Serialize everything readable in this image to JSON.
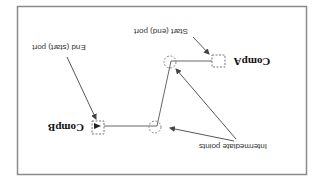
{
  "diagram": {
    "orientation": "rotated 180 degrees",
    "colors": {
      "frame": "#8a8a8a",
      "line": "#555555",
      "dashed": "#777777",
      "text": "#333333",
      "background": "#ffffff"
    },
    "components": [
      {
        "id": "comp-a",
        "label": "CompA"
      },
      {
        "id": "comp-b",
        "label": "CompB"
      }
    ],
    "annotations": {
      "start_end_port": "Start (end) port",
      "end_start_port": "End (start) port",
      "intermediate_points": "Intermediate points"
    },
    "connector": {
      "from": "CompA",
      "to": "CompB",
      "intermediate_point_count": 2
    }
  }
}
